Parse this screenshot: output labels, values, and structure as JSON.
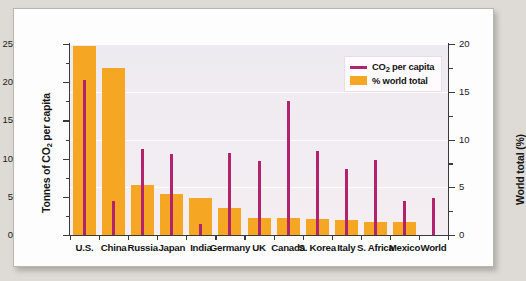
{
  "chart_data": {
    "type": "bar",
    "title": "",
    "subtitle": "",
    "categories": [
      "U.S.",
      "China",
      "Russia",
      "Japan",
      "India",
      "Germany",
      "UK",
      "Canada",
      "S. Korea",
      "Italy",
      "S. Africa",
      "Mexico",
      "World"
    ],
    "series": [
      {
        "name": "CO2 per capita",
        "legend_label": "CO₂ per capita",
        "type": "line",
        "marker": "vertical-line",
        "color": "#b1246d",
        "axis": "left",
        "unit": "tonnes",
        "values": [
          20.3,
          4.5,
          11.2,
          10.6,
          1.4,
          10.8,
          9.7,
          17.5,
          11.0,
          8.7,
          9.8,
          4.4,
          4.9
        ]
      },
      {
        "name": "% world total",
        "legend_label": "% world total",
        "type": "bar",
        "color": "#f5a623",
        "axis": "right",
        "unit": "%",
        "values": [
          19.8,
          17.5,
          5.2,
          4.3,
          3.9,
          2.8,
          1.8,
          1.8,
          1.7,
          1.6,
          1.4,
          1.4,
          0
        ]
      }
    ],
    "left_axis": {
      "label_plain": "Tonnes of CO2 per capita",
      "label_pre": "Tonnes of CO",
      "label_sub": "2",
      "label_post": " per capita",
      "ticks": [
        0,
        5,
        10,
        15,
        20,
        25
      ],
      "minor_ticks": [
        2.5,
        7.5,
        12.5,
        17.5,
        22.5
      ],
      "ylim": [
        0,
        25
      ]
    },
    "right_axis": {
      "label": "World total (%)",
      "ticks": [
        0,
        5,
        10,
        15,
        20
      ],
      "minor_ticks": [
        2.5,
        7.5,
        12.5,
        17.5
      ],
      "ylim": [
        0,
        20
      ]
    },
    "xlabel": "",
    "grid": "horizontal-white-faint",
    "legend_position": "top-right-inside",
    "plot_background": "#f0ebf1"
  },
  "colors": {
    "bar": "#f5a623",
    "line": "#b1246d",
    "plot_bg": "#f0ebf1",
    "card_bg": "#fdfdfd",
    "page_bg": "#dedbd6",
    "axis": "#3a3a3a",
    "text": "#141414"
  }
}
